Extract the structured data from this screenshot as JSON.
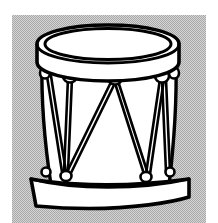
{
  "figure": {
    "style": "black-and-white line art clipart",
    "caption": "",
    "canvas": {
      "width": 218,
      "height": 223,
      "background_color": "#ffffff"
    },
    "panel": {
      "name": "halftone-background-panel",
      "x": 12,
      "y": 15,
      "width": 194,
      "height": 208,
      "fill_color": "#c2c2c2",
      "dither": "checkerboard halftone",
      "dither_light": "#d8d8d8",
      "dither_dark": "#a8a8a8"
    },
    "colors": {
      "outline": "#000000",
      "shell_fill": "#ffffff",
      "head_fill": "#ffffff",
      "rim_fill": "#ffffff",
      "lug_fill": "#ffffff",
      "background": "#c2c2c2",
      "page": "#ffffff"
    },
    "parts": [
      {
        "name": "top-rim-hoop",
        "label": "Top rim / counter hoop"
      },
      {
        "name": "drum-head",
        "label": "Batter head"
      },
      {
        "name": "shell",
        "label": "Drum shell"
      },
      {
        "name": "tension-ropes",
        "label": "Zigzag tension ropes"
      },
      {
        "name": "lug-top-left",
        "label": "Top lug (left)"
      },
      {
        "name": "lug-top-center",
        "label": "Top lug (center)"
      },
      {
        "name": "lug-top-right",
        "label": "Top lug (right)"
      },
      {
        "name": "lug-edge-left",
        "label": "Side lug (left edge)"
      },
      {
        "name": "lug-edge-right",
        "label": "Side lug (right edge)"
      },
      {
        "name": "lug-bottom-left",
        "label": "Bottom lug (left)"
      },
      {
        "name": "lug-bottom-center",
        "label": "Bottom lug (center)"
      },
      {
        "name": "lug-bottom-right",
        "label": "Bottom lug (right)"
      },
      {
        "name": "bottom-rim-hoop",
        "label": "Bottom rim / counter hoop"
      }
    ],
    "geometry": {
      "shell": {
        "top_left_x": 42,
        "top_right_x": 176,
        "top_y": 66,
        "bottom_left_x": 52,
        "bottom_right_x": 168,
        "bottom_y": 183
      },
      "top_rim": {
        "center_x": 108,
        "center_y": 46,
        "radius_x": 71,
        "radius_y": 20,
        "band_depth": 22
      },
      "head": {
        "center_x": 108,
        "center_y": 45,
        "radius_x": 63,
        "radius_y": 16
      },
      "bottom_rim": {
        "left_x": 34,
        "right_x": 186,
        "top_y": 180,
        "depth": 28,
        "sag": 14
      },
      "lug_radius": 6
    }
  }
}
